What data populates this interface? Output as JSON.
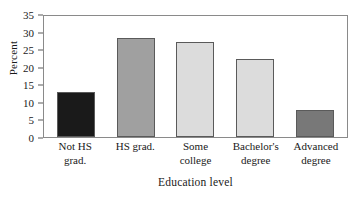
{
  "chart_data": {
    "type": "bar",
    "title": "",
    "xlabel": "Education level",
    "ylabel": "Percent",
    "categories": [
      "Not HS grad.",
      "HS grad.",
      "Some college",
      "Bachelor's degree",
      "Advanced degree"
    ],
    "category_lines": [
      [
        "Not HS",
        "grad."
      ],
      [
        "HS grad."
      ],
      [
        "Some",
        "college"
      ],
      [
        "Bachelor's",
        "degree"
      ],
      [
        "Advanced",
        "degree"
      ]
    ],
    "values": [
      12.8,
      28.3,
      27.1,
      22.2,
      7.7
    ],
    "ylim": [
      0,
      35
    ],
    "yticks": [
      0,
      5,
      10,
      15,
      20,
      25,
      30,
      35
    ],
    "ytick_labels": [
      "0",
      "5",
      "10",
      "15",
      "20",
      "25",
      "30",
      "35"
    ],
    "grid": false,
    "legend": "none",
    "bar_colors": [
      "#1a1a1a",
      "#a0a0a0",
      "#dcdcdc",
      "#dcdcdc",
      "#787878"
    ],
    "bar_edge_color": "#5a5a5a",
    "frame_color": "#8a8a8a",
    "text_color": "#1a1a1a",
    "background": "#ffffff"
  }
}
